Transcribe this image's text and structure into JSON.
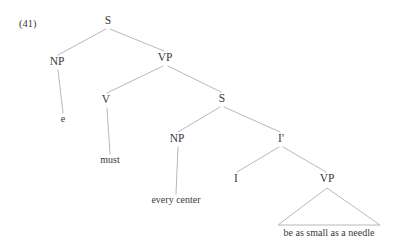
{
  "figure": {
    "example_number": "(41)",
    "background_color": "#ffffff",
    "text_color": "#3a3a3a",
    "line_color": "#b0b0b0"
  },
  "tree": {
    "nodes": [
      {
        "id": "s-root",
        "label": "S",
        "x": 108,
        "y": 24,
        "kind": "category"
      },
      {
        "id": "np-subject",
        "label": "NP",
        "x": 57,
        "y": 65,
        "kind": "category"
      },
      {
        "id": "vp-matrix",
        "label": "VP",
        "x": 165,
        "y": 61,
        "kind": "category"
      },
      {
        "id": "e-trace",
        "label": "e",
        "x": 63,
        "y": 122,
        "kind": "terminal"
      },
      {
        "id": "v-modal",
        "label": "V",
        "x": 106,
        "y": 103,
        "kind": "category"
      },
      {
        "id": "s-embedded",
        "label": "S",
        "x": 222,
        "y": 102,
        "kind": "category"
      },
      {
        "id": "must",
        "label": "must",
        "x": 110,
        "y": 163,
        "kind": "terminal"
      },
      {
        "id": "np-embedded",
        "label": "NP",
        "x": 177,
        "y": 142,
        "kind": "category"
      },
      {
        "id": "i-bar",
        "label": "I'",
        "x": 281,
        "y": 142,
        "kind": "category"
      },
      {
        "id": "every-center",
        "label": "every center",
        "x": 176,
        "y": 203,
        "kind": "terminal"
      },
      {
        "id": "i-head",
        "label": "I",
        "x": 236,
        "y": 182,
        "kind": "category"
      },
      {
        "id": "vp-lower",
        "label": "VP",
        "x": 327,
        "y": 182,
        "kind": "category"
      },
      {
        "id": "needle",
        "label": "be as small as a needle",
        "x": 329,
        "y": 236,
        "kind": "terminal"
      }
    ],
    "edges": [
      {
        "id": "edge-s-np",
        "from": "s-root",
        "to": "np-subject",
        "x1": 106,
        "y1": 29,
        "x2": 58,
        "y2": 55
      },
      {
        "id": "edge-s-vp",
        "from": "s-root",
        "to": "vp-matrix",
        "x1": 110,
        "y1": 29,
        "x2": 164,
        "y2": 51
      },
      {
        "id": "edge-np-e",
        "from": "np-subject",
        "to": "e-trace",
        "x1": 58,
        "y1": 70,
        "x2": 63,
        "y2": 113
      },
      {
        "id": "edge-vp-v",
        "from": "vp-matrix",
        "to": "v-modal",
        "x1": 163,
        "y1": 66,
        "x2": 107,
        "y2": 93
      },
      {
        "id": "edge-vp-s",
        "from": "vp-matrix",
        "to": "s-embedded",
        "x1": 168,
        "y1": 66,
        "x2": 221,
        "y2": 92
      },
      {
        "id": "edge-v-must",
        "from": "v-modal",
        "to": "must",
        "x1": 107,
        "y1": 108,
        "x2": 110,
        "y2": 154
      },
      {
        "id": "edge-s-npemb",
        "from": "s-embedded",
        "to": "np-embedded",
        "x1": 220,
        "y1": 107,
        "x2": 178,
        "y2": 132
      },
      {
        "id": "edge-s-ibar",
        "from": "s-embedded",
        "to": "i-bar",
        "x1": 224,
        "y1": 107,
        "x2": 280,
        "y2": 132
      },
      {
        "id": "edge-np-every",
        "from": "np-embedded",
        "to": "every-center",
        "x1": 178,
        "y1": 147,
        "x2": 176,
        "y2": 194
      },
      {
        "id": "edge-ibar-i",
        "from": "i-bar",
        "to": "i-head",
        "x1": 279,
        "y1": 147,
        "x2": 237,
        "y2": 172
      },
      {
        "id": "edge-ibar-vp",
        "from": "i-bar",
        "to": "vp-lower",
        "x1": 283,
        "y1": 147,
        "x2": 326,
        "y2": 172
      }
    ],
    "triangles": [
      {
        "id": "triangle-vp-lower",
        "from": "vp-lower",
        "to": "needle",
        "apex_x": 327,
        "apex_y": 188,
        "left_x": 278,
        "left_y": 225,
        "right_x": 380,
        "right_y": 225
      }
    ]
  }
}
